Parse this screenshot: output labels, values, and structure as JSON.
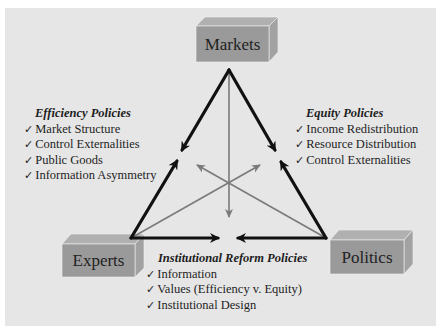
{
  "nodes": {
    "markets": "Markets",
    "experts": "Experts",
    "politics": "Politics"
  },
  "policies": {
    "efficiency": {
      "title": "Efficiency Policies",
      "items": [
        "Market Structure",
        "Control Externalities",
        "Public Goods",
        "Information Asymmetry"
      ]
    },
    "equity": {
      "title": "Equity Policies",
      "items": [
        "Income Redistribution",
        "Resource Distribution",
        "Control Externalities"
      ]
    },
    "institutional": {
      "title": "Institutional Reform Policies",
      "items": [
        "Information",
        "Values (Efficiency v. Equity)",
        "Institutional Design"
      ]
    }
  },
  "icons": {
    "check": "✓"
  },
  "colors": {
    "background": "#e6e6e6",
    "box_front": "#9a9a9a",
    "box_top": "#b0b0b0",
    "box_side": "#a4a4a4",
    "triangle": "#111111",
    "inner_arrows": "#7a7a7a"
  }
}
